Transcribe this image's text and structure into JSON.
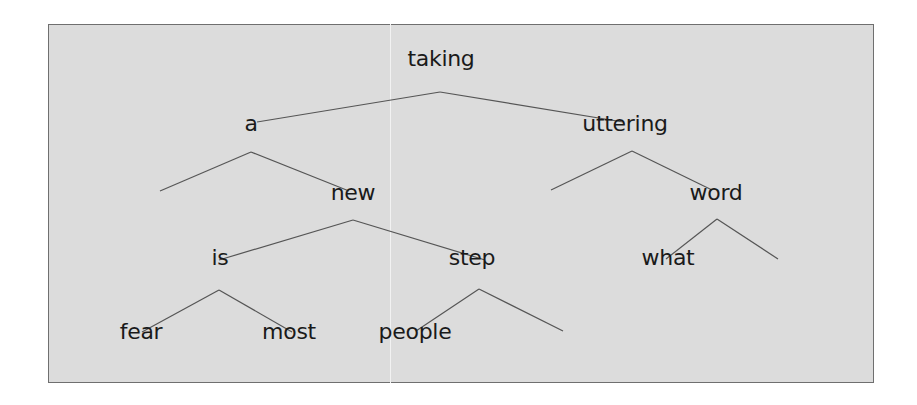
{
  "tree": {
    "nodes": [
      {
        "id": "taking",
        "label": "taking",
        "x": 441,
        "y": 63
      },
      {
        "id": "a",
        "label": "a",
        "x": 251,
        "y": 128
      },
      {
        "id": "uttering",
        "label": "uttering",
        "x": 625,
        "y": 128
      },
      {
        "id": "new",
        "label": "new",
        "x": 353,
        "y": 197
      },
      {
        "id": "word",
        "label": "word",
        "x": 716,
        "y": 197
      },
      {
        "id": "is",
        "label": "is",
        "x": 220,
        "y": 262
      },
      {
        "id": "step",
        "label": "step",
        "x": 472,
        "y": 262
      },
      {
        "id": "what",
        "label": "what",
        "x": 668,
        "y": 262
      },
      {
        "id": "fear",
        "label": "fear",
        "x": 141,
        "y": 336
      },
      {
        "id": "most",
        "label": "most",
        "x": 289,
        "y": 336
      },
      {
        "id": "people",
        "label": "people",
        "x": 415,
        "y": 336
      }
    ],
    "edges": [
      {
        "x1": 440,
        "y1": 92,
        "x2": 257,
        "y2": 122
      },
      {
        "x1": 440,
        "y1": 92,
        "x2": 623,
        "y2": 122
      },
      {
        "x1": 251,
        "y1": 152,
        "x2": 160,
        "y2": 191
      },
      {
        "x1": 251,
        "y1": 152,
        "x2": 349,
        "y2": 191
      },
      {
        "x1": 632,
        "y1": 151,
        "x2": 551,
        "y2": 190
      },
      {
        "x1": 632,
        "y1": 151,
        "x2": 712,
        "y2": 190
      },
      {
        "x1": 353,
        "y1": 220,
        "x2": 219,
        "y2": 260
      },
      {
        "x1": 353,
        "y1": 220,
        "x2": 485,
        "y2": 260
      },
      {
        "x1": 717,
        "y1": 219,
        "x2": 666,
        "y2": 259
      },
      {
        "x1": 717,
        "y1": 219,
        "x2": 778,
        "y2": 259
      },
      {
        "x1": 219,
        "y1": 290,
        "x2": 142,
        "y2": 332
      },
      {
        "x1": 219,
        "y1": 290,
        "x2": 292,
        "y2": 332
      },
      {
        "x1": 479,
        "y1": 289,
        "x2": 416,
        "y2": 331
      },
      {
        "x1": 479,
        "y1": 289,
        "x2": 563,
        "y2": 331
      }
    ]
  },
  "colors": {
    "background": "#dcdcdc",
    "edge": "#555555",
    "text": "#1a1a1a"
  }
}
